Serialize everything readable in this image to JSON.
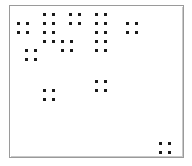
{
  "chart_data": {
    "type": "scatter",
    "title": "",
    "subtitle": "",
    "xlabel": "",
    "ylabel": "",
    "legend": [],
    "annotations": [],
    "grid": false,
    "axis_tick_labels": {
      "x": [],
      "y": []
    },
    "xlim": [
      0,
      192
    ],
    "ylim": [
      0,
      166
    ],
    "marker": {
      "shape": "square",
      "size_px": 3,
      "color": "#1a1a1a"
    },
    "plot_frame": {
      "x": 9,
      "y": 5,
      "width": 175,
      "height": 153,
      "border_color": "#9a9a9a",
      "background": "#ffffff"
    },
    "point_count": 38,
    "points": [
      {
        "x": 44,
        "y": 14
      },
      {
        "x": 53,
        "y": 14
      },
      {
        "x": 70,
        "y": 14
      },
      {
        "x": 79,
        "y": 14
      },
      {
        "x": 96,
        "y": 14
      },
      {
        "x": 105,
        "y": 14
      },
      {
        "x": 18,
        "y": 23
      },
      {
        "x": 27,
        "y": 23
      },
      {
        "x": 44,
        "y": 23
      },
      {
        "x": 53,
        "y": 23
      },
      {
        "x": 70,
        "y": 23
      },
      {
        "x": 79,
        "y": 23
      },
      {
        "x": 96,
        "y": 23
      },
      {
        "x": 105,
        "y": 23
      },
      {
        "x": 127,
        "y": 23
      },
      {
        "x": 136,
        "y": 23
      },
      {
        "x": 18,
        "y": 32
      },
      {
        "x": 27,
        "y": 32
      },
      {
        "x": 44,
        "y": 32
      },
      {
        "x": 53,
        "y": 32
      },
      {
        "x": 96,
        "y": 32
      },
      {
        "x": 105,
        "y": 32
      },
      {
        "x": 127,
        "y": 32
      },
      {
        "x": 136,
        "y": 32
      },
      {
        "x": 44,
        "y": 41
      },
      {
        "x": 53,
        "y": 41
      },
      {
        "x": 62,
        "y": 41
      },
      {
        "x": 71,
        "y": 41
      },
      {
        "x": 96,
        "y": 41
      },
      {
        "x": 105,
        "y": 41
      },
      {
        "x": 26,
        "y": 50
      },
      {
        "x": 35,
        "y": 50
      },
      {
        "x": 62,
        "y": 50
      },
      {
        "x": 71,
        "y": 50
      },
      {
        "x": 96,
        "y": 50
      },
      {
        "x": 105,
        "y": 50
      },
      {
        "x": 26,
        "y": 59
      },
      {
        "x": 35,
        "y": 59
      },
      {
        "x": 96,
        "y": 81
      },
      {
        "x": 105,
        "y": 81
      },
      {
        "x": 44,
        "y": 90
      },
      {
        "x": 53,
        "y": 90
      },
      {
        "x": 96,
        "y": 90
      },
      {
        "x": 105,
        "y": 90
      },
      {
        "x": 44,
        "y": 99
      },
      {
        "x": 53,
        "y": 99
      },
      {
        "x": 160,
        "y": 143
      },
      {
        "x": 169,
        "y": 143
      },
      {
        "x": 160,
        "y": 152
      },
      {
        "x": 169,
        "y": 152
      }
    ]
  }
}
